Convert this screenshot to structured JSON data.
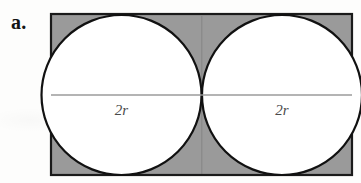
{
  "figure": {
    "part_label": "a.",
    "colors": {
      "page_background": "#fdfdfc",
      "rectangle_fill": "#9a9a9a",
      "rectangle_stroke": "#1a1a1a",
      "circle_fill": "#ffffff",
      "circle_stroke": "#111111",
      "diameter_line": "#9b9b9b",
      "label_text": "#141414",
      "diameter_label_text": "#4a4a4a"
    },
    "rectangle": {
      "x": 51,
      "y": 14,
      "width": 301,
      "height": 161,
      "stroke_width": 2.2
    },
    "circles": [
      {
        "name": "left-circle",
        "cx": 121.5,
        "cy": 95,
        "r": 80,
        "stroke_width": 2.2,
        "diameter_label": "2r",
        "label_x": 121.5,
        "label_y": 115
      },
      {
        "name": "right-circle",
        "cx": 282.0,
        "cy": 95,
        "r": 80,
        "stroke_width": 2.2,
        "diameter_label": "2r",
        "label_x": 282.0,
        "label_y": 115
      }
    ],
    "diameter_lines": [
      {
        "name": "left-diameter",
        "x1": 51,
        "y1": 95,
        "x2": 202,
        "y2": 95,
        "stroke_width": 1.6
      },
      {
        "name": "right-diameter",
        "x1": 202,
        "y1": 95,
        "x2": 352,
        "y2": 95,
        "stroke_width": 1.6
      }
    ]
  }
}
